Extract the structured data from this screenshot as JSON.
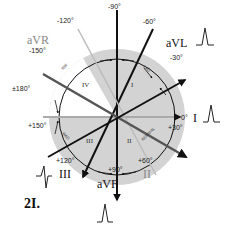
{
  "figure_label": "2I.",
  "center": {
    "x": 117,
    "y": 117
  },
  "colors": {
    "disk_fill": "#d3d3d3",
    "white_sector": "#ffffff",
    "lead_line": "#111111",
    "grey_lead_line": "#555555",
    "light_lead_line": "#aaaaaa"
  },
  "angles": {
    "m90": "-90°",
    "m60": "-60°",
    "m30": "-30°",
    "zero": "0°",
    "p30": "+30°",
    "p60": "+60°",
    "p90": "+90°",
    "p120": "+120°",
    "p150": "+150°",
    "pm180": "±180°",
    "m150": "-150°",
    "m120": "-120°"
  },
  "leads": {
    "I": "I",
    "II": "II",
    "III": "III",
    "aVR": "aVR",
    "aVL": "aVL",
    "aVF": "aVF"
  },
  "quadrants": {
    "q1": "I",
    "q2": "II",
    "q3": "III",
    "q4": "IV"
  },
  "arc_labels": {
    "lad": "LAD",
    "rad": "RAD",
    "normal": "NORMAL",
    "nw": "NW"
  }
}
